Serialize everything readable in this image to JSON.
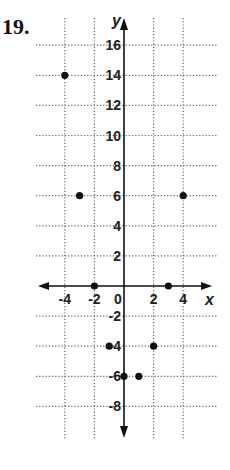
{
  "problem_number": "19.",
  "chart_data": {
    "type": "scatter",
    "title": "",
    "xlabel": "x",
    "ylabel": "y",
    "xlim": [
      -5,
      5
    ],
    "ylim": [
      -9,
      17
    ],
    "grid": true,
    "x_ticks": [
      -4,
      -2,
      0,
      2,
      4
    ],
    "y_ticks": [
      16,
      14,
      12,
      10,
      8,
      6,
      4,
      2,
      -2,
      -4,
      -6,
      -8
    ],
    "x_tick_labels": [
      "-4",
      "-2",
      "0",
      "2",
      "4"
    ],
    "y_tick_labels": [
      "16",
      "14",
      "12",
      "10",
      "8",
      "6",
      "4",
      "2",
      "-2",
      "-4",
      "-6",
      "-8"
    ],
    "points": [
      {
        "x": -4,
        "y": 14
      },
      {
        "x": -3,
        "y": 6
      },
      {
        "x": 4,
        "y": 6
      },
      {
        "x": -2,
        "y": 0
      },
      {
        "x": 3,
        "y": 0
      },
      {
        "x": -1,
        "y": -4
      },
      {
        "x": 2,
        "y": -4
      },
      {
        "x": 0,
        "y": -6
      },
      {
        "x": 1,
        "y": -6
      }
    ],
    "colors": {
      "ink": "#111111",
      "grid": "#666666"
    }
  }
}
